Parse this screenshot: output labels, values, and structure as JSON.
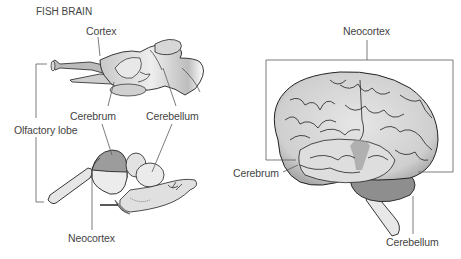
{
  "fish": {
    "title": "FISH BRAIN",
    "labels": {
      "cortex": "Cortex",
      "cerebrum": "Cerebrum",
      "cerebellum": "Cerebellum",
      "olfactory_lobe": "Olfactory lobe",
      "neocortex": "Neocortex"
    }
  },
  "human": {
    "labels": {
      "neocortex": "Neocortex",
      "cerebrum": "Cerebrum",
      "cerebellum": "Cerebellum"
    }
  },
  "colors": {
    "line": "#5a5a5a",
    "brain_fill": "#e4e4e4",
    "brain_shade": "#a8a8a8",
    "highlight": "#8f8f8f"
  }
}
